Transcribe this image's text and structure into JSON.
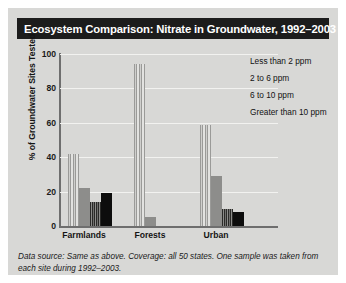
{
  "title": "Ecosystem Comparison: Nitrate in Groundwater, 1992–2003",
  "ylabel": "% of Groundwater Sites Tested",
  "footnote": "Data source: Same as above. Coverage: all 50 states. One sample was taken from each site during 1992–2003.",
  "yticks": [
    "100",
    "80",
    "60",
    "40",
    "20",
    "0"
  ],
  "legend": [
    {
      "label": "Less than 2 ppm",
      "swatch": "light-striped-swatch-icon",
      "color": "#b4b4b2"
    },
    {
      "label": "2 to 6 ppm",
      "swatch": "gray-solid-swatch-icon",
      "color": "#8d8d8b"
    },
    {
      "label": "6 to 10 ppm",
      "swatch": "dark-striped-swatch-icon",
      "color": "#3a3a38"
    },
    {
      "label": "Greater than 10 ppm",
      "swatch": "black-solid-swatch-icon",
      "color": "#0d0d0d"
    }
  ],
  "xticks": [
    "Farmlands",
    "Forests",
    "Urban"
  ],
  "chart_data": {
    "type": "bar",
    "title": "Ecosystem Comparison: Nitrate in Groundwater, 1992–2003",
    "xlabel": "",
    "ylabel": "% of Groundwater Sites Tested",
    "ylim": [
      0,
      100
    ],
    "yticks": [
      0,
      20,
      40,
      60,
      80,
      100
    ],
    "grid": true,
    "legend_position": "top-right",
    "categories": [
      "Farmlands",
      "Forests",
      "Urban"
    ],
    "series": [
      {
        "name": "Less than 2 ppm",
        "values": [
          42,
          94,
          59
        ]
      },
      {
        "name": "2 to 6 ppm",
        "values": [
          22,
          5,
          29
        ]
      },
      {
        "name": "6 to 10 ppm",
        "values": [
          14,
          0,
          10
        ]
      },
      {
        "name": "Greater than 10 ppm",
        "values": [
          19,
          0,
          8
        ]
      }
    ]
  }
}
